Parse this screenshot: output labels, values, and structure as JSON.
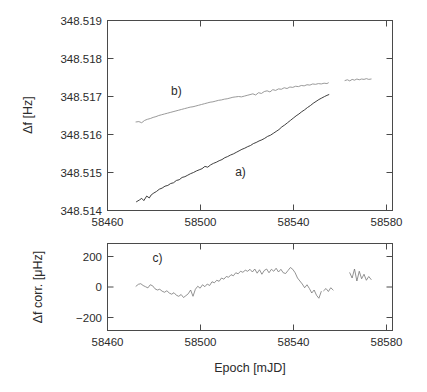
{
  "figure": {
    "background_color": "#ffffff",
    "xlabel": "Epoch [mJD]"
  },
  "chart_data": [
    {
      "type": "line",
      "panel": "top",
      "title": "",
      "xlabel": "",
      "ylabel": "Δf [Hz]",
      "xlim": [
        58460,
        58580
      ],
      "ylim": [
        348.514,
        348.519
      ],
      "xticks": [
        58460,
        58500,
        58540,
        58580
      ],
      "xticklabels": [
        "58460",
        "58500",
        "58540",
        "58580"
      ],
      "yticks": [
        348.514,
        348.515,
        348.516,
        348.517,
        348.518,
        348.519
      ],
      "yticklabels": [
        "348.514",
        "348.515",
        "348.516",
        "348.517",
        "348.518",
        "348.519"
      ],
      "grid": false,
      "legend": "none",
      "annotations": [
        {
          "text": "a)",
          "x": 58516,
          "y": 348.5149
        },
        {
          "text": "b)",
          "x": 58489,
          "y": 348.51705
        }
      ],
      "series": [
        {
          "name": "a)",
          "color": "#2a2a2a",
          "x": [
            58472.2,
            58473.5,
            58474.4,
            58475.3,
            58476.5,
            58477.6,
            58478.4,
            58479.5,
            58480.6,
            58481.8,
            58483.0,
            58484.2,
            58485.4,
            58486.6,
            58487.8,
            58489.0,
            58490.2,
            58491.4,
            58492.6,
            58493.8,
            58495.0,
            58496.2,
            58497.4,
            58498.6,
            58499.8,
            58501.0,
            58502.2,
            58503.4,
            58504.6,
            58505.8,
            58507.0,
            58508.2,
            58509.4,
            58510.6,
            58511.8,
            58513.0,
            58514.2,
            58515.4,
            58516.6,
            58517.8,
            58519.0,
            58520.2,
            58521.4,
            58522.6,
            58523.8,
            58525.0,
            58526.2,
            58527.4,
            58528.6,
            58529.8,
            58531.0,
            58532.2,
            58533.4,
            58534.6,
            58535.8,
            58537.0,
            58538.2,
            58539.4,
            58540.6,
            58541.8,
            58543.0,
            58544.2,
            58545.4,
            58546.6,
            58547.8,
            58549.0,
            58550.2,
            58551.4,
            58552.4,
            58553.2
          ],
          "y": [
            348.51423,
            348.51428,
            348.51432,
            348.51426,
            348.51438,
            348.51433,
            348.51441,
            348.51446,
            348.5145,
            348.51456,
            348.51459,
            348.51464,
            348.51466,
            348.51471,
            348.51473,
            348.51479,
            348.51481,
            348.51487,
            348.51489,
            348.51493,
            348.51497,
            348.515,
            348.51504,
            348.51507,
            348.5151,
            348.51516,
            348.51514,
            348.5152,
            348.51524,
            348.51527,
            348.51531,
            348.51534,
            348.51539,
            348.51542,
            348.51546,
            348.51549,
            348.51553,
            348.51557,
            348.51561,
            348.51564,
            348.51568,
            348.51571,
            348.51576,
            348.51579,
            348.51583,
            348.51586,
            348.5159,
            348.51595,
            348.51598,
            348.51603,
            348.51608,
            348.51613,
            348.5162,
            348.51625,
            348.51631,
            348.51637,
            348.51643,
            348.51649,
            348.51654,
            348.5166,
            348.51665,
            348.51671,
            348.51676,
            348.51682,
            348.51687,
            348.51692,
            348.51696,
            348.517,
            348.51703,
            348.51705
          ],
          "gap_note": "single continuous segment ending near 58553"
        },
        {
          "name": "b)",
          "color": "#8e8e8e",
          "segments": [
            {
              "x": [
                58472.0,
                58473.2,
                58474.4,
                58475.6,
                58476.8,
                58478.0,
                58479.2,
                58480.4,
                58481.6,
                58482.8,
                58484.0,
                58485.2,
                58486.4,
                58487.6,
                58488.8,
                58490.0,
                58491.2,
                58492.4,
                58493.6,
                58494.8,
                58496.0,
                58497.2,
                58498.4,
                58499.6,
                58500.8,
                58502.0,
                58503.2,
                58504.4,
                58505.6,
                58506.8,
                58508.0,
                58509.2,
                58510.4,
                58511.6,
                58512.8,
                58514.0,
                58515.2,
                58516.4,
                58517.6,
                58518.8,
                58520.0,
                58521.2,
                58522.4,
                58523.6,
                58524.8,
                58526.0,
                58527.2,
                58528.4,
                58529.6,
                58530.8,
                58532.0,
                58533.2,
                58534.4,
                58535.6,
                58536.8,
                58538.0,
                58539.2,
                58540.4,
                58541.6,
                58542.8,
                58544.0,
                58545.2,
                58546.4,
                58547.6,
                58548.8,
                58550.0,
                58551.2,
                58552.4,
                58553.0
              ],
              "y": [
                348.51633,
                348.51634,
                348.51631,
                348.51637,
                348.5164,
                348.51642,
                348.51645,
                348.51647,
                348.5165,
                348.51652,
                348.51654,
                348.51656,
                348.51658,
                348.5166,
                348.51662,
                348.51664,
                348.51666,
                348.51668,
                348.5167,
                348.51672,
                348.51673,
                348.51675,
                348.51677,
                348.51679,
                348.51681,
                348.51683,
                348.51685,
                348.51686,
                348.51688,
                348.5169,
                348.51691,
                348.51693,
                348.51694,
                348.51696,
                348.51698,
                348.51699,
                348.517,
                348.51699,
                348.51701,
                348.51703,
                348.51705,
                348.51707,
                348.51704,
                348.5171,
                348.51708,
                348.51713,
                348.51715,
                348.51712,
                348.51718,
                348.51716,
                348.5172,
                348.51719,
                348.51723,
                348.51721,
                348.51725,
                348.51724,
                348.51727,
                348.51726,
                348.51729,
                348.51728,
                348.51731,
                348.5173,
                348.51733,
                348.51732,
                348.51734,
                348.51733,
                348.51735,
                348.51734,
                348.51736
              ]
            },
            {
              "x": [
                58560.0,
                58561.0,
                58562.0,
                58563.0,
                58564.0,
                58565.0,
                58566.0,
                58567.0,
                58568.0,
                58569.0,
                58570.0,
                58571.0
              ],
              "y": [
                348.51742,
                348.51744,
                348.51741,
                348.51745,
                348.51743,
                348.51746,
                348.51744,
                348.51746,
                348.51745,
                348.51747,
                348.51745,
                348.51746
              ]
            }
          ]
        }
      ]
    },
    {
      "type": "line",
      "panel": "bottom",
      "title": "",
      "xlabel": "Epoch [mJD]",
      "ylabel": "Δf corr. [μHz]",
      "xlim": [
        58460,
        58580
      ],
      "ylim": [
        -290,
        290
      ],
      "xticks": [
        58460,
        58500,
        58540,
        58580
      ],
      "xticklabels": [
        "58460",
        "58500",
        "58540",
        "58580"
      ],
      "yticks": [
        -200,
        0,
        200
      ],
      "yticklabels": [
        "−200",
        "0",
        "200"
      ],
      "grid": false,
      "legend": "none",
      "annotations": [
        {
          "text": "c)",
          "x": 58481,
          "y": 168
        }
      ],
      "series": [
        {
          "name": "c)",
          "color": "#6f6f6f",
          "units": "μHz",
          "segments": [
            {
              "x": [
                58472,
                58473,
                58474,
                58475,
                58476,
                58477,
                58478,
                58479,
                58480,
                58481,
                58482,
                58483,
                58484,
                58485,
                58486,
                58487,
                58488,
                58489,
                58490,
                58491,
                58492,
                58493,
                58494,
                58495,
                58496,
                58497,
                58498,
                58499,
                58500,
                58501,
                58502,
                58503,
                58504,
                58505,
                58506,
                58507,
                58508,
                58509,
                58510,
                58511,
                58512,
                58513,
                58514,
                58515,
                58516,
                58517,
                58518,
                58519,
                58520,
                58521,
                58522,
                58523,
                58524,
                58525,
                58526,
                58527,
                58528,
                58529,
                58530,
                58531,
                58532,
                58533,
                58534,
                58535,
                58536,
                58537,
                58538,
                58539,
                58540,
                58541,
                58542,
                58543,
                58544,
                58545,
                58546,
                58547,
                58548,
                58549,
                58550
              ],
              "y": [
                5,
                18,
                22,
                10,
                2,
                -6,
                15,
                8,
                -12,
                -20,
                -15,
                -28,
                -35,
                -25,
                -40,
                -48,
                -38,
                -55,
                -62,
                -50,
                -70,
                -58,
                -45,
                -20,
                -62,
                -15,
                5,
                -8,
                15,
                2,
                20,
                10,
                35,
                28,
                45,
                38,
                60,
                52,
                70,
                65,
                82,
                75,
                95,
                88,
                105,
                98,
                112,
                105,
                118,
                100,
                120,
                92,
                115,
                85,
                110,
                120,
                95,
                118,
                105,
                125,
                100,
                118,
                95,
                90,
                110,
                130,
                118,
                95,
                60,
                40,
                20,
                -5,
                15,
                -10,
                -40,
                -20,
                -55,
                -75,
                -30
              ]
            },
            {
              "x": [
                58551,
                58552,
                58553,
                58554,
                58555
              ],
              "y": [
                -25,
                -10,
                -30,
                -5,
                -20
              ]
            },
            {
              "x": [
                58562,
                58563,
                58564,
                58565,
                58566,
                58567,
                58568,
                58569,
                58570,
                58571
              ],
              "y": [
                95,
                60,
                120,
                40,
                105,
                55,
                85,
                45,
                70,
                50
              ]
            }
          ]
        }
      ]
    }
  ]
}
